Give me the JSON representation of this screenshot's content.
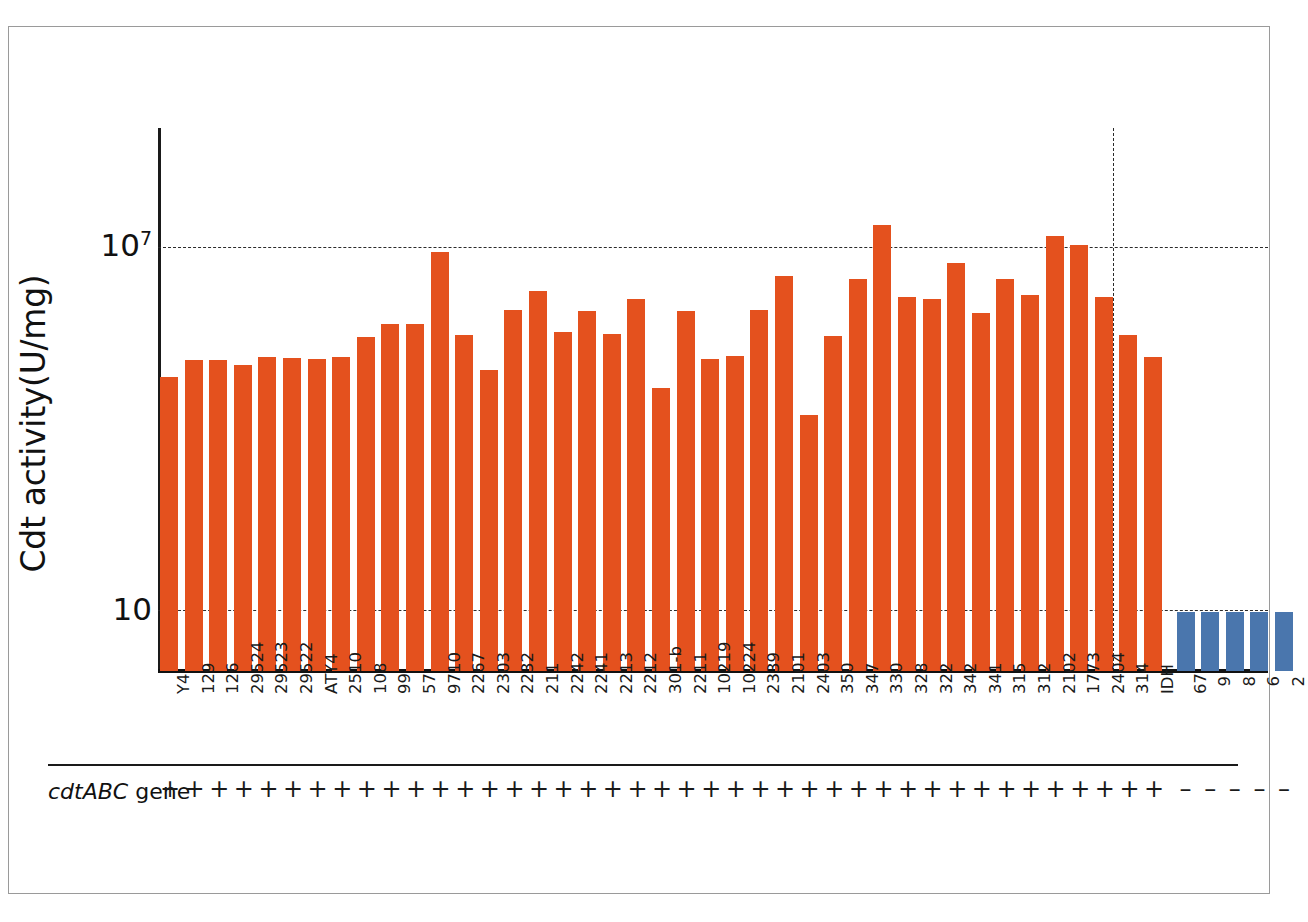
{
  "figure": {
    "y_axis_title": "Cdt activity(U/mg)",
    "y_ticks": [
      {
        "label_base": "10",
        "label_exp": "7",
        "value": 10000000
      },
      {
        "label_base": "10",
        "label_exp": "",
        "value": 10
      }
    ],
    "gene_row": {
      "label_italic": "cdtABC",
      "label_rest": " gene",
      "positive_symbol": "+",
      "negative_symbol": "–"
    },
    "colors": {
      "orange": "#e4511e",
      "blue": "#4a76ad",
      "axis": "#1a1a1a",
      "grid": "#2b2b2b",
      "frame": "#9a9a9a",
      "background": "#ffffff"
    }
  },
  "chart_data": {
    "type": "bar",
    "title": "",
    "xlabel": "",
    "ylabel": "Cdt activity(U/mg)",
    "yscale": "log",
    "ylim": [
      6.5,
      60000000
    ],
    "grid": true,
    "gridlines": [
      10,
      10000000
    ],
    "legend": "none",
    "annotations": [
      "Vertical dashed divider separates cdtABC-positive strains (orange) from cdtABC-negative strains (blue)",
      "cdtABC gene row: + for all orange bars, – for all blue bars"
    ],
    "categories": [
      "Y4",
      "129",
      "126",
      "29524",
      "29523",
      "29522",
      "ATY4",
      "2510",
      "108",
      "99",
      "57",
      "9710",
      "2267",
      "2303",
      "2232",
      "211",
      "2242",
      "2241",
      "2213",
      "2212",
      "301-b",
      "2211",
      "10219",
      "10224",
      "2339",
      "2101",
      "2403",
      "350",
      "347",
      "330",
      "328",
      "322",
      "342",
      "341",
      "315",
      "312",
      "2102",
      "1773",
      "2404",
      "314",
      "IDH",
      "67",
      "9",
      "8",
      "6",
      "2"
    ],
    "values": [
      72000,
      135000,
      135000,
      112000,
      150000,
      145000,
      140000,
      150000,
      330000,
      540000,
      540000,
      8300000,
      350000,
      93000,
      900000,
      1900000,
      390000,
      860000,
      360000,
      1400000,
      47000,
      860000,
      140000,
      160000,
      920000,
      3300000,
      17000,
      340000,
      3000000,
      23000000,
      1500000,
      1400000,
      5500000,
      820000,
      3000000,
      1600000,
      15000000,
      11000000,
      1500000,
      350000,
      150000,
      9.3,
      9.3,
      9.3,
      9.3,
      9.3
    ],
    "series_groups": [
      {
        "name": "cdtABC positive",
        "color": "#e4511e",
        "count": 41
      },
      {
        "name": "cdtABC negative",
        "color": "#4a76ad",
        "count": 5
      }
    ],
    "gene_presence": [
      "+",
      "+",
      "+",
      "+",
      "+",
      "+",
      "+",
      "+",
      "+",
      "+",
      "+",
      "+",
      "+",
      "+",
      "+",
      "+",
      "+",
      "+",
      "+",
      "+",
      "+",
      "+",
      "+",
      "+",
      "+",
      "+",
      "+",
      "+",
      "+",
      "+",
      "+",
      "+",
      "+",
      "+",
      "+",
      "+",
      "+",
      "+",
      "+",
      "+",
      "+",
      "–",
      "–",
      "–",
      "–",
      "–"
    ]
  }
}
